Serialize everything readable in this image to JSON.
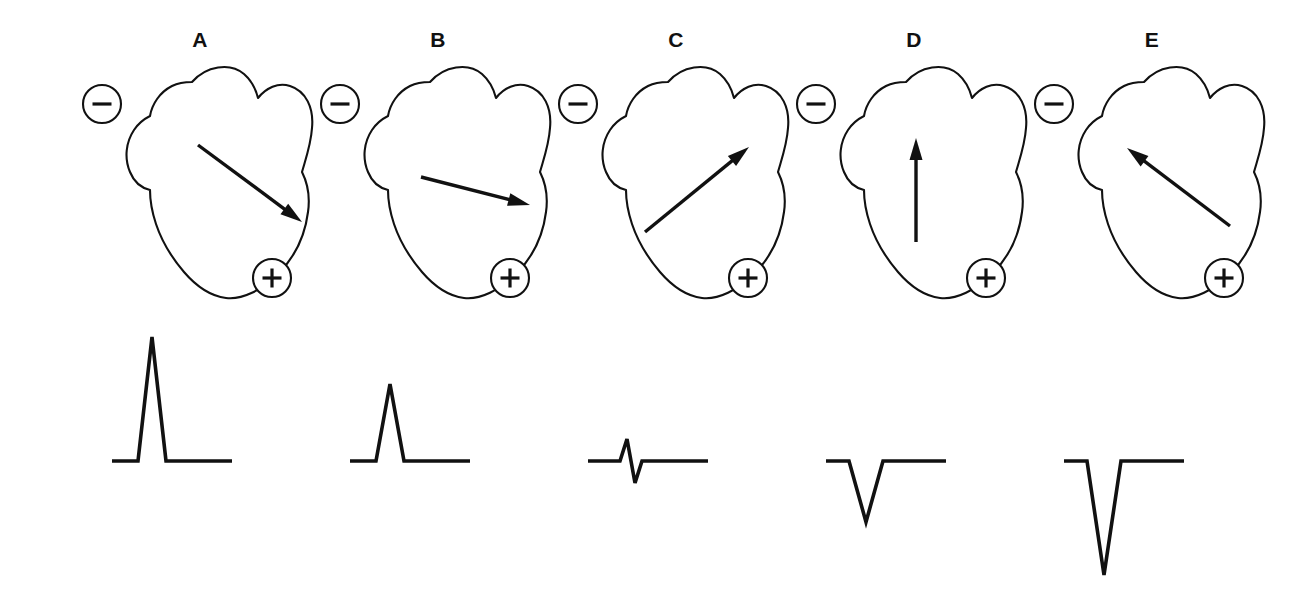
{
  "figure": {
    "background_color": "#ffffff",
    "ink_color": "#111111",
    "width": 1298,
    "height": 606
  },
  "panels": [
    {
      "label": "A",
      "negative_electrode": "−",
      "positive_electrode": "+",
      "vector": {
        "description": "arrow pointing down and to the right, directly toward the positive electrode",
        "angle_to_lead_axis_deg": 0,
        "x1": 118,
        "y1": 85,
        "x2": 222,
        "y2": 162
      },
      "ecg": {
        "deflection": "large positive",
        "amplitude_px": 124,
        "direction": "up"
      }
    },
    {
      "label": "B",
      "negative_electrode": "−",
      "positive_electrode": "+",
      "vector": {
        "description": "arrow pointing right and slightly downward, partly toward the positive electrode",
        "angle_to_lead_axis_deg": 30,
        "x1": 103,
        "y1": 117,
        "x2": 212,
        "y2": 145
      },
      "ecg": {
        "deflection": "small positive",
        "amplitude_px": 77,
        "direction": "up"
      }
    },
    {
      "label": "C",
      "negative_electrode": "−",
      "positive_electrode": "+",
      "vector": {
        "description": "arrow pointing up and to the right, perpendicular to the lead axis",
        "angle_to_lead_axis_deg": 90,
        "x1": 89,
        "y1": 172,
        "x2": 193,
        "y2": 87
      },
      "ecg": {
        "deflection": "biphasic (equiphasic)",
        "amplitude_px": 22,
        "direction": "up then down"
      }
    },
    {
      "label": "D",
      "negative_electrode": "−",
      "positive_electrode": "+",
      "vector": {
        "description": "arrow pointing straight up, angled away from the positive electrode",
        "angle_to_lead_axis_deg": 135,
        "x1": 122,
        "y1": 182,
        "x2": 122,
        "y2": 78
      },
      "ecg": {
        "deflection": "negative",
        "amplitude_px": 61,
        "direction": "down"
      }
    },
    {
      "label": "E",
      "negative_electrode": "−",
      "positive_electrode": "+",
      "vector": {
        "description": "arrow pointing up and to the left, directly away from the positive electrode",
        "angle_to_lead_axis_deg": 180,
        "x1": 198,
        "y1": 166,
        "x2": 95,
        "y2": 88
      },
      "ecg": {
        "deflection": "large negative",
        "amplitude_px": 114,
        "direction": "down"
      }
    }
  ],
  "geometry": {
    "panel_width": 240,
    "panel_origins_x": [
      80,
      318,
      556,
      794,
      1032
    ],
    "ecg_baseline_y": 141,
    "ecg_trace_start_x": 32,
    "ecg_trace_end_x": 152,
    "heart_path": "M 112 22 C 126 6 150 2 164 14 C 172 21 176 30 178 38 C 186 28 198 22 210 26 C 226 31 234 48 232 68 C 231 84 226 98 222 112 C 228 124 230 138 228 152 C 225 176 214 198 198 214 C 182 230 162 240 146 238 C 130 236 116 226 104 212 C 92 198 82 182 76 164 C 72 152 70 140 70 130 C 62 128 54 122 50 112 C 44 98 46 82 54 70 C 58 64 64 59 70 56 C 72 44 80 32 92 26 C 98 23 105 22 112 22 Z",
    "electrode_minus": {
      "cx": 22,
      "cy": 44,
      "r": 19
    },
    "electrode_plus": {
      "cx": 192,
      "cy": 218,
      "r": 19
    }
  }
}
